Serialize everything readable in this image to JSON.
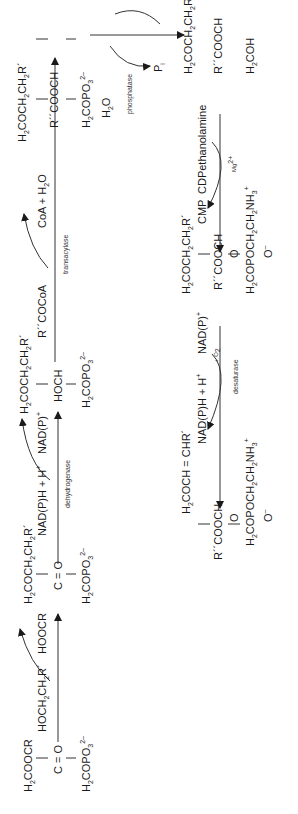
{
  "diagram": {
    "orientation": "rotated-90-ccw",
    "compounds": {
      "dhap_acyl": {
        "row1": "H2COOCR",
        "row2": "C = O",
        "row3": "H2COPO3 2-"
      },
      "alkyl_dhap": {
        "row1": "H2COCH2CH2R'",
        "row2": "C = O",
        "row3": "H2COPO3 2-"
      },
      "alkyl_g3p": {
        "row1": "H2COCH2CH2R'",
        "row2": "HOCH",
        "row3": "H2COPO3 2-"
      },
      "alkyl_acyl_g3p": {
        "row1": "H2COCH2CH2R'",
        "row2": "R''COOCH",
        "row3": "H2COPO3 2-"
      },
      "alkyl_acyl_glycerol": {
        "row1": "H2COCH2CH2R'",
        "row2": "R''COOCH",
        "row3": "H2COH"
      },
      "alkyl_acyl_gpe": {
        "row1": "H2COCH2CH2R'",
        "row2": "R''COOCH",
        "row3": "H2COPOCH2CH2NH3+",
        "oxo": "O",
        "anion": "O−"
      },
      "plasmalogen": {
        "row1": "H2COCH = CHR'",
        "row2": "R''COOCH",
        "row3": "H2COPOCH2CH2NH3+",
        "oxo": "O",
        "anion": "O−"
      }
    },
    "reactions": [
      {
        "step": 1,
        "in": "HOCH2CH2R'",
        "out": "HOOCR",
        "enzyme": ""
      },
      {
        "step": 2,
        "in": "NAD(P)H + H+",
        "out": "NAD(P)+",
        "enzyme": "dehydrogenase"
      },
      {
        "step": 3,
        "in": "R''COCoA",
        "out": "CoA + H2O",
        "enzyme": "transacylase"
      },
      {
        "step": 4,
        "in": "H2O",
        "out": "Pi",
        "enzyme": "phosphatase"
      },
      {
        "step": 5,
        "in": "CDPethanolamine",
        "out": "CMP",
        "enzyme": "Mg2+"
      },
      {
        "step": 6,
        "in": "NAD(P)H + H+ + O2",
        "out": "NAD(P)+",
        "enzyme": "desaturase"
      }
    ]
  }
}
